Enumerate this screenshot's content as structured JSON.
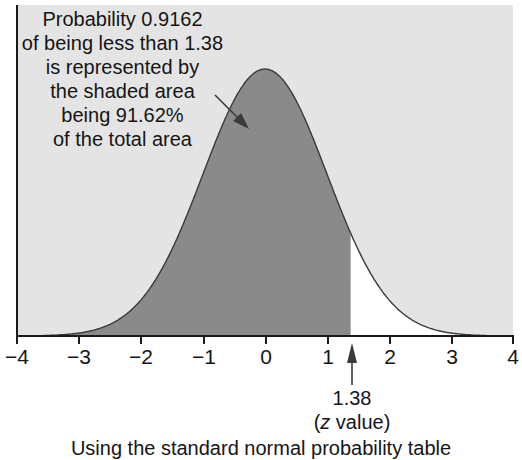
{
  "chart_data": {
    "type": "area",
    "title": "",
    "subtitle": "",
    "xlabel": "(z value)",
    "ylabel": "",
    "xlim": [
      -4,
      4
    ],
    "ylim": [
      0,
      0.42
    ],
    "grid": false,
    "legend": null,
    "x_ticks": [
      -4,
      -3,
      -2,
      -1,
      0,
      1,
      2,
      3,
      4
    ],
    "x_tick_labels": [
      "−4",
      "−3",
      "−2",
      "−1",
      "0",
      "1",
      "2",
      "3",
      "4"
    ],
    "series": [
      {
        "name": "Standard normal pdf",
        "mean": 0,
        "sd": 1,
        "x": [
          -4,
          -3,
          -2,
          -1,
          0,
          1,
          1.38,
          2,
          3,
          4
        ],
        "y": [
          0.0001,
          0.0044,
          0.054,
          0.242,
          0.3989,
          0.242,
          0.1539,
          0.054,
          0.0044,
          0.0001
        ]
      }
    ],
    "shaded_region": {
      "from": -4,
      "to": 1.38,
      "probability": 0.9162,
      "percent": "91.62%"
    },
    "annotations": [
      {
        "text": "Probability 0.9162 of being less than 1.38 is represented by the shaded area being 91.62% of the total area",
        "points_to": "shaded area"
      },
      {
        "text": "1.38 (z value)",
        "x": 1.38,
        "arrow": "up"
      }
    ],
    "colors": {
      "background": "#e4e4e4",
      "shaded": "#8a8a8a",
      "unshaded_under_curve": "#ffffff",
      "curve": "#3a3a3a",
      "axis": "#1a1a1a"
    }
  },
  "annotation": {
    "lines": [
      "Probability 0.9162",
      "of being less than 1.38",
      "is represented by",
      "the shaded area",
      "being 91.62%",
      "of the total area"
    ]
  },
  "axis": {
    "ticks": [
      {
        "label": "−4",
        "x": 17
      },
      {
        "label": "−3",
        "x": 79
      },
      {
        "label": "−2",
        "x": 141
      },
      {
        "label": "−1",
        "x": 204
      },
      {
        "label": "0",
        "x": 266
      },
      {
        "label": "1",
        "x": 328
      },
      {
        "label": "2",
        "x": 390
      },
      {
        "label": "3",
        "x": 452
      },
      {
        "label": "4",
        "x": 513
      }
    ]
  },
  "z_marker": {
    "value": "1.38",
    "label_prefix": "(",
    "label_var": "z",
    "label_suffix": " value)"
  },
  "caption": "Using the standard normal probability table"
}
